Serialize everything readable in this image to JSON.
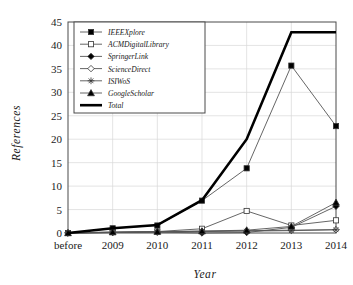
{
  "chart_data": {
    "type": "line",
    "title": "",
    "xlabel": "Year",
    "ylabel": "References",
    "categories": [
      "before",
      "2009",
      "2010",
      "2011",
      "2012",
      "2013",
      "2014"
    ],
    "ylim": [
      0,
      45
    ],
    "yticks": [
      0,
      5,
      10,
      15,
      20,
      25,
      30,
      35,
      40,
      45
    ],
    "grid": true,
    "legend_position": "top-left",
    "series": [
      {
        "name": "IEEEXplore",
        "marker": "filled-square",
        "values": [
          0,
          1,
          1.6,
          6.9,
          13.8,
          35.7,
          22.8
        ]
      },
      {
        "name": "ACMDigitalLibrary",
        "marker": "open-square",
        "values": [
          0,
          0.2,
          0.3,
          0.9,
          4.7,
          1.6,
          2.7
        ]
      },
      {
        "name": "SpringerLink",
        "marker": "filled-diamond",
        "values": [
          0,
          0.1,
          0.2,
          0.0,
          0.1,
          1.2,
          5.7
        ]
      },
      {
        "name": "ScienceDirect",
        "marker": "open-diamond",
        "values": [
          0,
          0.1,
          0.2,
          0.4,
          0.5,
          0.6,
          0.7
        ]
      },
      {
        "name": "ISIWoS",
        "marker": "star",
        "values": [
          0,
          0.1,
          0.2,
          0.3,
          0.4,
          0.5,
          0.7
        ]
      },
      {
        "name": "GoogleScholar",
        "marker": "filled-triangle",
        "values": [
          0,
          0.2,
          0.3,
          0.4,
          0.6,
          1.4,
          6.5
        ]
      },
      {
        "name": "Total",
        "marker": "none",
        "values": [
          0,
          1.0,
          1.7,
          7.0,
          20.0,
          42.8,
          42.8
        ]
      }
    ]
  }
}
